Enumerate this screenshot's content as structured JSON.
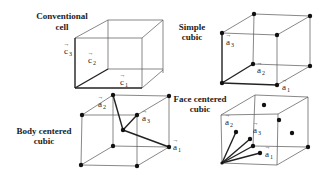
{
  "panels": {
    "conventional": {
      "title_line1": "Conventional",
      "title_line2": "cell",
      "vectors": [
        {
          "name": "c",
          "sub": "1"
        },
        {
          "name": "c",
          "sub": "2"
        },
        {
          "name": "c",
          "sub": "3"
        }
      ]
    },
    "simple_cubic": {
      "title_line1": "Simple",
      "title_line2": "cubic",
      "vectors": [
        {
          "name": "a",
          "sub": "1"
        },
        {
          "name": "a",
          "sub": "2"
        },
        {
          "name": "a",
          "sub": "3"
        }
      ]
    },
    "body_centered": {
      "title_line1": "Body centered",
      "title_line2": "cubic",
      "vectors": [
        {
          "name": "a",
          "sub": "1"
        },
        {
          "name": "a",
          "sub": "2"
        },
        {
          "name": "a",
          "sub": "3"
        }
      ]
    },
    "face_centered": {
      "title_line1": "Face centered",
      "title_line2": "cubic",
      "vectors": [
        {
          "name": "a",
          "sub": "1"
        },
        {
          "name": "a",
          "sub": "2"
        },
        {
          "name": "a",
          "sub": "3"
        }
      ]
    }
  },
  "arrow_glyph": "→"
}
